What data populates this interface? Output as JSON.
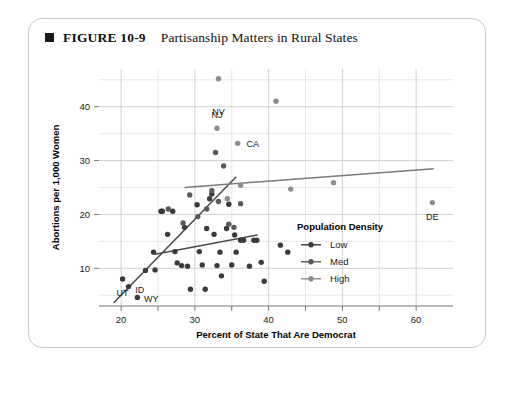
{
  "figure": {
    "marker": "filled-square",
    "number": "FIGURE 10-9",
    "title": "Partisanship Matters in Rural States"
  },
  "chart_data": {
    "type": "scatter",
    "title": "Partisanship Matters in Rural States",
    "xlabel": "Percent of State That Are Democrat",
    "ylabel": "Abortions per 1,000 Women",
    "xlim": [
      17,
      65
    ],
    "ylim": [
      3,
      47
    ],
    "xticks": [
      20,
      30,
      40,
      50,
      60
    ],
    "yticks": [
      10,
      20,
      30,
      40
    ],
    "xticks_minor": [
      25,
      35,
      45,
      55
    ],
    "yticks_minor": [
      5,
      15,
      25,
      35,
      45
    ],
    "grid": true,
    "legend": {
      "title": "Population Density",
      "position": "inside-right",
      "entries": [
        {
          "name": "Low",
          "color": "#3a3a3a"
        },
        {
          "name": "Med",
          "color": "#5a5a5a"
        },
        {
          "name": "High",
          "color": "#8d8d8d"
        }
      ]
    },
    "series": [
      {
        "name": "Low",
        "color": "#3a3a3a",
        "points": [
          [
            20.2,
            8.0
          ],
          [
            21.0,
            6.6
          ],
          [
            22.2,
            4.6
          ],
          [
            23.3,
            9.6
          ],
          [
            24.6,
            9.7
          ],
          [
            24.4,
            13.0
          ],
          [
            25.4,
            20.6
          ],
          [
            25.6,
            20.6
          ],
          [
            26.3,
            16.3
          ],
          [
            27.0,
            20.6
          ],
          [
            27.3,
            13.1
          ],
          [
            27.6,
            11.0
          ],
          [
            28.2,
            10.5
          ],
          [
            28.6,
            17.6
          ],
          [
            29.0,
            10.4
          ],
          [
            29.4,
            6.1
          ],
          [
            30.3,
            21.8
          ],
          [
            30.6,
            13.1
          ],
          [
            31.0,
            10.6
          ],
          [
            31.4,
            6.1
          ],
          [
            31.6,
            17.4
          ],
          [
            32.0,
            22.9
          ],
          [
            32.3,
            23.8
          ],
          [
            32.6,
            16.3
          ],
          [
            33.0,
            10.5
          ],
          [
            33.4,
            13.0
          ],
          [
            33.6,
            8.6
          ],
          [
            34.3,
            17.4
          ],
          [
            34.6,
            21.9
          ],
          [
            35.0,
            10.6
          ],
          [
            35.4,
            16.2
          ],
          [
            35.6,
            13.0
          ],
          [
            36.2,
            15.2
          ],
          [
            36.6,
            15.2
          ],
          [
            37.4,
            10.4
          ],
          [
            38.0,
            15.2
          ],
          [
            38.4,
            15.2
          ],
          [
            39.0,
            11.1
          ],
          [
            39.4,
            7.6
          ],
          [
            41.6,
            14.3
          ],
          [
            42.6,
            13.0
          ]
        ]
      },
      {
        "name": "Med",
        "color": "#5a5a5a",
        "points": [
          [
            26.4,
            21.0
          ],
          [
            28.4,
            18.4
          ],
          [
            29.3,
            23.6
          ],
          [
            30.4,
            19.6
          ],
          [
            31.6,
            21.0
          ],
          [
            32.3,
            24.4
          ],
          [
            32.8,
            31.5
          ],
          [
            33.2,
            22.4
          ],
          [
            33.9,
            29.0
          ],
          [
            34.6,
            18.2
          ],
          [
            35.3,
            17.6
          ],
          [
            36.2,
            22.0
          ]
        ]
      },
      {
        "name": "High",
        "color": "#8d8d8d",
        "points": [
          [
            33.2,
            45.2
          ],
          [
            33.0,
            36.0
          ],
          [
            35.8,
            33.2
          ],
          [
            34.4,
            22.9
          ],
          [
            36.2,
            25.4
          ],
          [
            41.0,
            41.0
          ],
          [
            43.0,
            24.7
          ],
          [
            48.8,
            25.9
          ],
          [
            62.2,
            22.2
          ]
        ]
      }
    ],
    "trend_lines": [
      {
        "name": "Low",
        "color": "#4a4a4a",
        "x0": 19.0,
        "y0": 3.6,
        "x1": 35.6,
        "y1": 27.0
      },
      {
        "name": "Med",
        "color": "#4a4a4a",
        "x0": 24.6,
        "y0": 12.6,
        "x1": 38.5,
        "y1": 16.2
      },
      {
        "name": "High",
        "color": "#7a7a7a",
        "x0": 28.6,
        "y0": 25.0,
        "x1": 62.4,
        "y1": 28.5
      }
    ],
    "annotations": [
      {
        "label": "NV",
        "x": 33.2,
        "y": 45.2,
        "dx": 0,
        "dy": -6.2,
        "anchor": "middle"
      },
      {
        "label": "NJ",
        "x": 33.0,
        "y": 36.0,
        "dx": 0,
        "dy": 2.6,
        "anchor": "middle"
      },
      {
        "label": "CA",
        "x": 35.8,
        "y": 33.2,
        "dx": 1.2,
        "dy": 0,
        "anchor": "start"
      },
      {
        "label": "DE",
        "x": 62.2,
        "y": 22.2,
        "dx": 0,
        "dy": -2.6,
        "anchor": "middle"
      },
      {
        "label": "UT",
        "x": 20.2,
        "y": 8.0,
        "dx": 0,
        "dy": -2.6,
        "anchor": "middle"
      },
      {
        "label": "ID",
        "x": 21.0,
        "y": 6.6,
        "dx": 0.9,
        "dy": -0.5,
        "anchor": "start"
      },
      {
        "label": "WY",
        "x": 22.2,
        "y": 4.6,
        "dx": 0.9,
        "dy": -0.3,
        "anchor": "start"
      }
    ]
  }
}
